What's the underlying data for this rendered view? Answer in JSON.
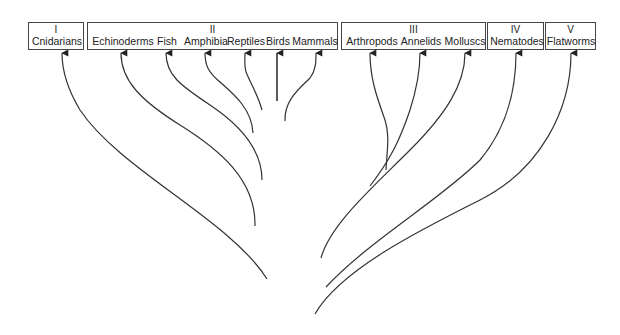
{
  "diagram": {
    "type": "phylogenetic-tree",
    "groups": [
      {
        "numeral": "I",
        "taxa": [
          "Cnidarians"
        ]
      },
      {
        "numeral": "II",
        "taxa": [
          "Echinoderms",
          "Fish",
          "Amphibia",
          "Reptiles",
          "Birds",
          "Mammals"
        ]
      },
      {
        "numeral": "III",
        "taxa": [
          "Arthropods",
          "Annelids",
          "Molluscs"
        ]
      },
      {
        "numeral": "IV",
        "taxa": [
          "Nematodes"
        ]
      },
      {
        "numeral": "V",
        "taxa": [
          "Flatworms"
        ]
      }
    ],
    "line_color": "#333333"
  }
}
